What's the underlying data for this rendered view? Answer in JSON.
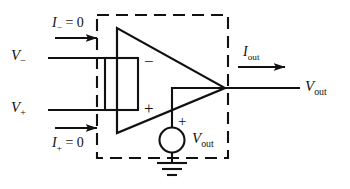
{
  "figure": {
    "type": "circuit-diagram",
    "background_color": "#ffffff",
    "line_color": "#111111"
  },
  "labels": {
    "current_minus": {
      "symbol": "I",
      "subscript": "−",
      "equals": " = 0",
      "text": "I− = 0"
    },
    "current_plus": {
      "symbol": "I",
      "subscript": "+",
      "equals": " = 0",
      "text": "I+ = 0"
    },
    "voltage_minus": {
      "symbol": "V",
      "subscript": "−",
      "text": "V−"
    },
    "voltage_plus": {
      "symbol": "V",
      "subscript": "+",
      "text": "V+"
    },
    "current_out": {
      "symbol": "I",
      "subscript": "out",
      "text": "Iout"
    },
    "voltage_out_terminal": {
      "symbol": "V",
      "subscript": "out",
      "text": "Vout"
    },
    "voltage_out_source": {
      "symbol": "V",
      "subscript": "out",
      "text": "Vout"
    }
  },
  "terminal_signs": {
    "inverting_input": "−",
    "noninverting_input": "+",
    "source_positive": "+"
  },
  "components": {
    "opamp_triangle": {
      "name": "operational-amplifier",
      "apex": "right"
    },
    "input_rectangle": {
      "name": "input-resistance-block"
    },
    "dependent_source": {
      "name": "dependent-voltage-source",
      "shape": "circle"
    },
    "ground": {
      "name": "ground-symbol"
    },
    "enclosure": {
      "name": "dashed-boundary-box",
      "style": "dashed"
    }
  },
  "arrows": {
    "minus_input_arrow": "arrow-right",
    "plus_input_arrow": "arrow-right",
    "output_arrow": "arrow-right"
  }
}
